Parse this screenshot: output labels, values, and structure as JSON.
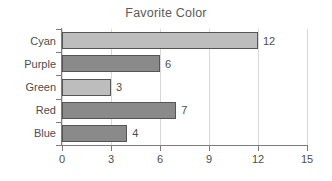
{
  "chart_data": {
    "type": "bar",
    "orientation": "horizontal",
    "title": "Favorite Color",
    "xlabel": "",
    "ylabel": "",
    "categories": [
      "Cyan",
      "Purple",
      "Green",
      "Red",
      "Blue"
    ],
    "values": [
      12,
      6,
      3,
      7,
      4
    ],
    "value_labels": [
      "12",
      "6",
      "3",
      "7",
      "4"
    ],
    "bar_colors": [
      "#bdbdbd",
      "#8a8a8a",
      "#bdbdbd",
      "#8a8a8a",
      "#8a8a8a"
    ],
    "bar_edge_color": "#555555",
    "xlim": [
      0,
      15
    ],
    "xticks": [
      0,
      3,
      6,
      9,
      12,
      15
    ],
    "xtick_labels": [
      "0",
      "3",
      "6",
      "9",
      "12",
      "15"
    ],
    "grid": true,
    "grid_axis": "x",
    "grid_color": "#d8d8d8",
    "axis_color": "#7d7d7d",
    "legend": null,
    "text_color": "#4d4d4d",
    "title_color": "#5a5a5a",
    "background_color": "#ffffff"
  }
}
